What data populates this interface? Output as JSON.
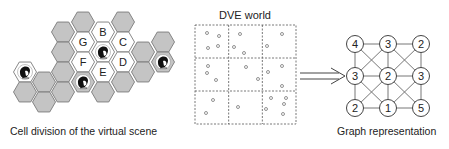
{
  "panels": {
    "left": {
      "caption": "Cell division of the virtual scene",
      "hex_radius": 11.5,
      "colors": {
        "gray": "#c4c4c4",
        "white": "#ffffff",
        "stroke": "#7a7a7a"
      },
      "cells": [
        {
          "x": 25,
          "y": 72,
          "fill": "white",
          "avatar": true,
          "label": ""
        },
        {
          "x": 25,
          "y": 92,
          "fill": "gray",
          "avatar": false,
          "label": ""
        },
        {
          "x": 44,
          "y": 82,
          "fill": "gray",
          "avatar": false,
          "label": ""
        },
        {
          "x": 44,
          "y": 102,
          "fill": "gray",
          "avatar": false,
          "label": ""
        },
        {
          "x": 63,
          "y": 32,
          "fill": "gray",
          "avatar": false,
          "label": ""
        },
        {
          "x": 63,
          "y": 52,
          "fill": "gray",
          "avatar": false,
          "label": ""
        },
        {
          "x": 63,
          "y": 72,
          "fill": "gray",
          "avatar": false,
          "label": ""
        },
        {
          "x": 63,
          "y": 92,
          "fill": "gray",
          "avatar": false,
          "label": ""
        },
        {
          "x": 83,
          "y": 22,
          "fill": "gray",
          "avatar": false,
          "label": ""
        },
        {
          "x": 83,
          "y": 42,
          "fill": "white",
          "avatar": false,
          "label": "G"
        },
        {
          "x": 83,
          "y": 62,
          "fill": "white",
          "avatar": false,
          "label": "F"
        },
        {
          "x": 83,
          "y": 82,
          "fill": "gray",
          "avatar": true,
          "label": ""
        },
        {
          "x": 103,
          "y": 32,
          "fill": "white",
          "avatar": false,
          "label": "B"
        },
        {
          "x": 103,
          "y": 52,
          "fill": "white",
          "avatar": true,
          "label": ""
        },
        {
          "x": 103,
          "y": 72,
          "fill": "white",
          "avatar": false,
          "label": "E"
        },
        {
          "x": 103,
          "y": 92,
          "fill": "gray",
          "avatar": false,
          "label": ""
        },
        {
          "x": 123,
          "y": 22,
          "fill": "gray",
          "avatar": false,
          "label": ""
        },
        {
          "x": 123,
          "y": 42,
          "fill": "white",
          "avatar": false,
          "label": "C"
        },
        {
          "x": 123,
          "y": 62,
          "fill": "white",
          "avatar": false,
          "label": "D"
        },
        {
          "x": 123,
          "y": 82,
          "fill": "gray",
          "avatar": false,
          "label": ""
        },
        {
          "x": 143,
          "y": 52,
          "fill": "gray",
          "avatar": false,
          "label": ""
        },
        {
          "x": 143,
          "y": 72,
          "fill": "gray",
          "avatar": false,
          "label": ""
        },
        {
          "x": 163,
          "y": 42,
          "fill": "gray",
          "avatar": false,
          "label": ""
        },
        {
          "x": 163,
          "y": 62,
          "fill": "gray",
          "avatar": true,
          "label": ""
        }
      ]
    },
    "middle": {
      "title": "DVE world",
      "grid": {
        "x": 195,
        "y": 25,
        "width": 101,
        "height": 99,
        "rows": 3,
        "cols": 3
      },
      "points": [
        [
          207,
          33
        ],
        [
          219,
          36
        ],
        [
          208,
          48
        ],
        [
          218,
          46
        ],
        [
          240,
          34
        ],
        [
          234,
          47
        ],
        [
          244,
          53
        ],
        [
          282,
          34
        ],
        [
          267,
          46
        ],
        [
          208,
          66
        ],
        [
          207,
          73
        ],
        [
          216,
          80
        ],
        [
          246,
          67
        ],
        [
          258,
          79
        ],
        [
          268,
          72
        ],
        [
          282,
          66
        ],
        [
          282,
          86
        ],
        [
          213,
          100
        ],
        [
          206,
          113
        ],
        [
          238,
          107
        ],
        [
          271,
          98
        ],
        [
          286,
          98
        ],
        [
          284,
          104
        ],
        [
          266,
          109
        ],
        [
          283,
          114
        ]
      ]
    },
    "arrow": {
      "x1": 300,
      "x2": 345,
      "y": 76
    },
    "right": {
      "caption": "Graph representation",
      "nodes": [
        {
          "id": "n00",
          "x": 355,
          "y": 44,
          "label": "4"
        },
        {
          "id": "n01",
          "x": 388,
          "y": 44,
          "label": "3"
        },
        {
          "id": "n02",
          "x": 421,
          "y": 44,
          "label": "2"
        },
        {
          "id": "n10",
          "x": 355,
          "y": 76,
          "label": "3"
        },
        {
          "id": "n11",
          "x": 388,
          "y": 76,
          "label": "2"
        },
        {
          "id": "n12",
          "x": 421,
          "y": 76,
          "label": "3"
        },
        {
          "id": "n20",
          "x": 355,
          "y": 108,
          "label": "2"
        },
        {
          "id": "n21",
          "x": 388,
          "y": 108,
          "label": "1"
        },
        {
          "id": "n22",
          "x": 421,
          "y": 108,
          "label": "5"
        }
      ],
      "edges": [
        [
          "n00",
          "n01"
        ],
        [
          "n01",
          "n02"
        ],
        [
          "n10",
          "n11"
        ],
        [
          "n11",
          "n12"
        ],
        [
          "n20",
          "n21"
        ],
        [
          "n21",
          "n22"
        ],
        [
          "n00",
          "n10"
        ],
        [
          "n10",
          "n20"
        ],
        [
          "n01",
          "n11"
        ],
        [
          "n11",
          "n21"
        ],
        [
          "n02",
          "n12"
        ],
        [
          "n12",
          "n22"
        ],
        [
          "n00",
          "n11"
        ],
        [
          "n01",
          "n10"
        ],
        [
          "n01",
          "n12"
        ],
        [
          "n02",
          "n11"
        ],
        [
          "n10",
          "n21"
        ],
        [
          "n11",
          "n20"
        ],
        [
          "n11",
          "n22"
        ],
        [
          "n12",
          "n21"
        ]
      ],
      "node_radius": 8.5
    }
  }
}
